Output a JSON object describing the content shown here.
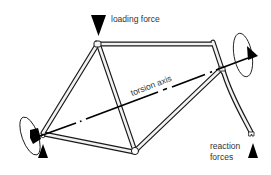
{
  "diagram": {
    "labels": {
      "loading_force": "loading force",
      "torsion_axis": "torsion axis",
      "reaction_forces_line1": "reaction",
      "reaction_forces_line2": "forces"
    },
    "colors": {
      "stroke": "#1a1a1a",
      "tube_fill": "#f2f2f2",
      "background": "#ffffff",
      "text": "#333333"
    }
  }
}
